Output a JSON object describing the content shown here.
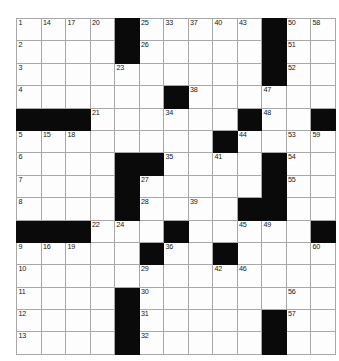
{
  "puzzle": {
    "type": "crossword-grid",
    "rows": 15,
    "cols": 13,
    "colors": {
      "block": "#0a0a0a",
      "cell": "#fdfdfd",
      "grid_line": "#a8a8a8",
      "border": "#8d8d8d",
      "number_text": "#161616",
      "page_background": "#ffffff"
    },
    "max_clue_number": 66,
    "cells": [
      [
        {
          "num": "1"
        },
        {
          "num": "2"
        },
        {
          "num": "3"
        },
        {
          "num": "4"
        },
        {
          "block": true
        },
        {
          "num": "5"
        },
        {
          "num": "6"
        },
        {
          "num": "7"
        },
        {
          "num": "8"
        },
        {
          "block": true
        },
        {
          "num": "9"
        },
        {
          "num": "10"
        },
        {
          "num": "11"
        },
        {
          "num": "12"
        },
        {
          "num": "13"
        }
      ],
      [
        {
          "num": "14"
        },
        {},
        {},
        {},
        {
          "block": true
        },
        {
          "num": "15"
        },
        {},
        {},
        {},
        {
          "block": true
        },
        {
          "num": "16"
        },
        {},
        {},
        {},
        {}
      ],
      [
        {
          "num": "17"
        },
        {},
        {},
        {},
        {
          "block": true
        },
        {
          "num": "18"
        },
        {},
        {},
        {},
        {
          "block": true
        },
        {
          "num": "19"
        },
        {},
        {},
        {},
        {}
      ],
      [
        {
          "num": "20"
        },
        {},
        {},
        {},
        {
          "num": "21"
        },
        {},
        {},
        {},
        {},
        {
          "num": "22"
        },
        {},
        {},
        {},
        {},
        {}
      ],
      [
        {
          "block": true
        },
        {
          "block": true
        },
        {
          "num": "23"
        },
        {},
        {},
        {},
        {
          "block": true
        },
        {
          "block": true
        },
        {
          "block": true
        },
        {
          "num": "24"
        },
        {},
        {},
        {
          "block": true
        },
        {
          "block": true
        },
        {
          "block": true
        }
      ],
      [
        {
          "num": "25"
        },
        {
          "num": "26"
        },
        {},
        {},
        {},
        {},
        {
          "block": true
        },
        {
          "num": "27"
        },
        {
          "num": "28"
        },
        {},
        {
          "block": true
        },
        {
          "num": "29"
        },
        {
          "num": "30"
        },
        {
          "num": "31"
        },
        {
          "num": "32"
        }
      ],
      [
        {
          "num": "33"
        },
        {},
        {},
        {
          "block": true
        },
        {
          "num": "34"
        },
        {},
        {
          "num": "35"
        },
        {},
        {},
        {
          "block": true
        },
        {
          "num": "36"
        },
        {},
        {},
        {},
        {}
      ],
      [
        {
          "num": "37"
        },
        {},
        {},
        {
          "num": "38"
        },
        {},
        {},
        {},
        {},
        {
          "num": "39"
        },
        {},
        {},
        {},
        {},
        {},
        {}
      ],
      [
        {
          "num": "40"
        },
        {},
        {},
        {},
        {},
        {
          "block": true
        },
        {
          "num": "41"
        },
        {},
        {},
        {},
        {
          "block": true
        },
        {
          "num": "42"
        },
        {},
        {},
        {}
      ],
      [
        {
          "num": "43"
        },
        {},
        {},
        {},
        {
          "block": true
        },
        {
          "num": "44"
        },
        {},
        {},
        {
          "block": true
        },
        {
          "num": "45"
        },
        {},
        {
          "num": "46"
        },
        {},
        {},
        {}
      ],
      [
        {
          "block": true
        },
        {
          "block": true
        },
        {
          "block": true
        },
        {
          "num": "47"
        },
        {
          "num": "48"
        },
        {},
        {
          "block": true
        },
        {
          "block": true
        },
        {
          "block": true
        },
        {
          "num": "49"
        },
        {},
        {},
        {},
        {
          "block": true
        },
        {
          "block": true
        }
      ],
      [
        {
          "num": "50"
        },
        {
          "num": "51"
        },
        {
          "num": "52"
        },
        {},
        {},
        {
          "num": "53"
        },
        {
          "num": "54"
        },
        {
          "num": "55"
        },
        {},
        {},
        {},
        {},
        {
          "num": "56"
        },
        {
          "num": "57"
        },
        {}
      ],
      [
        {
          "num": "58"
        },
        {},
        {},
        {},
        {
          "block": true
        },
        {
          "num": "59"
        },
        {},
        {},
        {},
        {
          "block": true
        },
        {
          "num": "60"
        },
        {},
        {},
        {},
        {}
      ],
      [
        {
          "num": "61"
        },
        {},
        {},
        {},
        {
          "block": true
        },
        {
          "num": "62"
        },
        {},
        {},
        {},
        {
          "block": true
        },
        {
          "num": "63"
        },
        {},
        {},
        {},
        {}
      ],
      [
        {
          "num": "64"
        },
        {},
        {},
        {},
        {
          "block": true
        },
        {
          "num": "65"
        },
        {},
        {},
        {},
        {
          "block": true
        },
        {
          "num": "66"
        },
        {},
        {},
        {},
        {}
      ]
    ]
  }
}
